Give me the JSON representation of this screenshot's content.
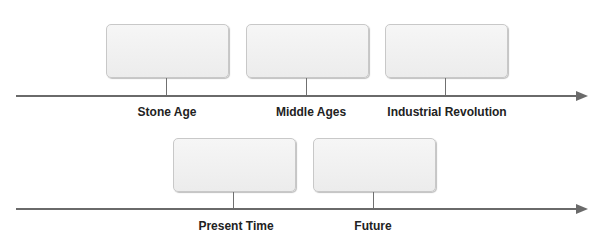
{
  "diagram": {
    "type": "timeline",
    "rows": [
      {
        "events": [
          {
            "label": "Stone Age"
          },
          {
            "label": "Middle Ages"
          },
          {
            "label": "Industrial Revolution"
          }
        ]
      },
      {
        "events": [
          {
            "label": "Present Time"
          },
          {
            "label": "Future"
          }
        ]
      }
    ],
    "colors": {
      "axis": "#6a6a6a",
      "box_fill": "#f0f0f0",
      "box_border": "#c8c8c8",
      "text": "#222222"
    }
  }
}
